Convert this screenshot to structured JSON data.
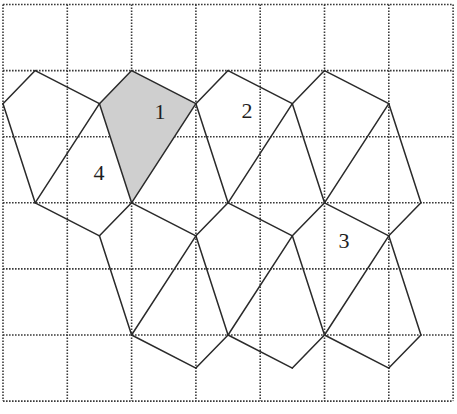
{
  "figure": {
    "grid": {
      "columns": 7,
      "rows": 6,
      "origin_px": [
        3,
        4.5
      ],
      "cell_px": [
        64.3,
        66.1
      ],
      "line_style": "dotted",
      "line_color": "#3a3a3a"
    },
    "colors": {
      "shaded_fill": "#cfcfcf",
      "edge": "#2a2a2a",
      "background": "#ffffff"
    },
    "points": {
      "A": [
        0.5,
        1
      ],
      "B": [
        0,
        1.5
      ],
      "C": [
        1.5,
        1.5
      ],
      "D": [
        2,
        1
      ],
      "E": [
        0.5,
        3
      ],
      "F": [
        2,
        3
      ],
      "G": [
        3,
        1.5
      ],
      "H": [
        3.5,
        1
      ],
      "I": [
        4.5,
        1.5
      ],
      "J": [
        3.5,
        3
      ],
      "K": [
        5,
        1
      ],
      "L": [
        5,
        3
      ],
      "M": [
        6,
        1.5
      ],
      "N": [
        6.5,
        3
      ],
      "P": [
        1.5,
        3.5
      ],
      "Q": [
        3,
        3.5
      ],
      "R": [
        2,
        5
      ],
      "S": [
        3.5,
        5
      ],
      "T": [
        4.5,
        3.5
      ],
      "U": [
        6,
        3.5
      ],
      "V": [
        5,
        5
      ],
      "W": [
        6.5,
        5
      ],
      "X": [
        3,
        5.5
      ],
      "Y": [
        4.5,
        5.5
      ],
      "Z": [
        6,
        5.5
      ]
    },
    "edges": [
      [
        "A",
        "B"
      ],
      [
        "A",
        "C"
      ],
      [
        "B",
        "E"
      ],
      [
        "C",
        "E"
      ],
      [
        "C",
        "F"
      ],
      [
        "D",
        "C"
      ],
      [
        "D",
        "G"
      ],
      [
        "G",
        "F"
      ],
      [
        "G",
        "H"
      ],
      [
        "H",
        "I"
      ],
      [
        "G",
        "J"
      ],
      [
        "I",
        "J"
      ],
      [
        "I",
        "K"
      ],
      [
        "K",
        "M"
      ],
      [
        "I",
        "L"
      ],
      [
        "M",
        "L"
      ],
      [
        "M",
        "N"
      ],
      [
        "E",
        "P"
      ],
      [
        "P",
        "F"
      ],
      [
        "F",
        "Q"
      ],
      [
        "Q",
        "J"
      ],
      [
        "P",
        "R"
      ],
      [
        "Q",
        "R"
      ],
      [
        "Q",
        "S"
      ],
      [
        "J",
        "T"
      ],
      [
        "T",
        "L"
      ],
      [
        "L",
        "U"
      ],
      [
        "U",
        "N"
      ],
      [
        "T",
        "S"
      ],
      [
        "T",
        "V"
      ],
      [
        "U",
        "V"
      ],
      [
        "U",
        "W"
      ],
      [
        "R",
        "X"
      ],
      [
        "X",
        "S"
      ],
      [
        "S",
        "Y"
      ],
      [
        "Y",
        "V"
      ],
      [
        "V",
        "Z"
      ],
      [
        "Z",
        "W"
      ]
    ],
    "shaded_region": {
      "label": "1",
      "vertices": [
        "D",
        "G",
        "F",
        "C"
      ]
    },
    "labels": [
      {
        "text": "1",
        "px": [
          160,
          111
        ]
      },
      {
        "text": "2",
        "px": [
          247,
          110
        ]
      },
      {
        "text": "3",
        "px": [
          344,
          240
        ]
      },
      {
        "text": "4",
        "px": [
          99,
          172
        ]
      }
    ]
  }
}
